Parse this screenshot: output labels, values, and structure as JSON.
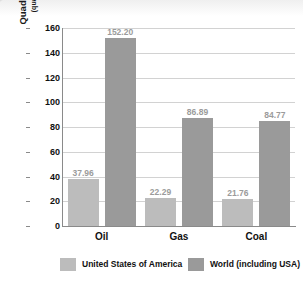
{
  "chart_data": {
    "type": "bar",
    "title": "",
    "subtitle": "",
    "categories": [
      "Oil",
      "Gas",
      "Coal"
    ],
    "series": [
      {
        "name": "United States of America",
        "values": [
          37.96,
          22.29,
          21.76
        ],
        "color": "#bcbcbc"
      },
      {
        "name": "World (including USA)",
        "values": [
          152.2,
          86.89,
          84.77
        ],
        "color": "#9a9a9a"
      }
    ],
    "data_labels": {
      "united_states_of_america": [
        "37.96",
        "22.29",
        "21.76"
      ],
      "world_including_usa": [
        "152.20",
        "86.89",
        "84.77"
      ]
    },
    "xlabel": "",
    "ylabel": "Quadrillion British thermal units",
    "ylabel_sub": "(quadrillion = 1 000 000 000 000 000)",
    "ylim": [
      0,
      160
    ],
    "ytick_step": 20,
    "ytick_labels": [
      "0",
      "20",
      "40",
      "60",
      "80",
      "100",
      "120",
      "140",
      "160"
    ],
    "grid": true,
    "grid_axis": "y",
    "legend_position": "bottom",
    "legend_entries": [
      "United States of America",
      "World (including USA)"
    ],
    "colors": {
      "usa_bar": "#bcbcbc",
      "world_bar": "#9a9a9a",
      "gridline": "#d2d2d2",
      "axis": "#8a8a8a",
      "data_label_text": "#9b9b9b",
      "tick_text": "#111111",
      "background": "#ffffff"
    }
  }
}
